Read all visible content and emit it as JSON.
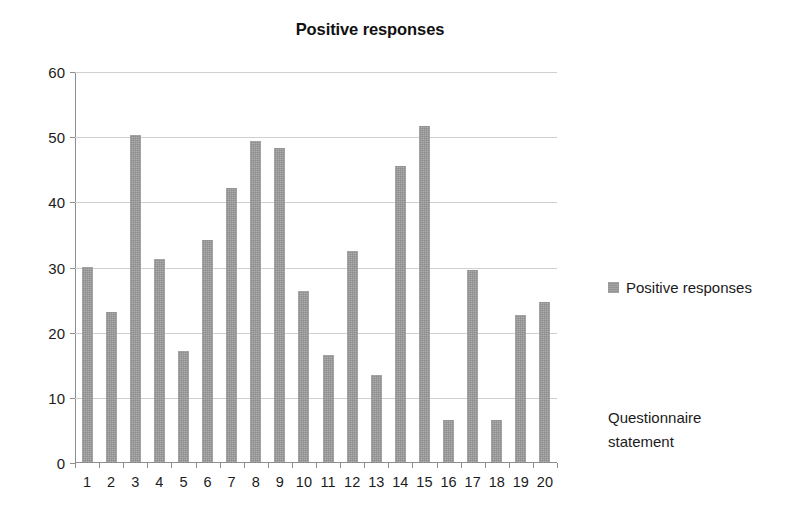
{
  "chart_data": {
    "type": "bar",
    "title": "Positive responses",
    "xlabel": "Questionnaire statement",
    "ylabel": "",
    "categories": [
      "1",
      "2",
      "3",
      "4",
      "5",
      "6",
      "7",
      "8",
      "9",
      "10",
      "11",
      "12",
      "13",
      "14",
      "15",
      "16",
      "17",
      "18",
      "19",
      "20"
    ],
    "series": [
      {
        "name": "Positive responses",
        "color": "#9a9a9a",
        "values": [
          30.0,
          23.0,
          50.2,
          31.1,
          17.1,
          34.1,
          42.1,
          49.2,
          48.2,
          26.3,
          16.4,
          32.4,
          13.4,
          45.4,
          51.5,
          6.5,
          29.5,
          6.5,
          22.6,
          24.6
        ]
      }
    ],
    "ylim": [
      0,
      60
    ],
    "yticks": [
      0,
      10,
      20,
      30,
      40,
      50,
      60
    ],
    "ytick_labels": [
      "0",
      "10",
      "20",
      "30",
      "40",
      "50",
      "60"
    ],
    "grid": true,
    "grid_axis": "y",
    "legend_position": "right",
    "legend_entries": [
      "Positive responses"
    ]
  },
  "chart": {
    "title": "Positive responses",
    "axis_caption_line1": "Questionnaire",
    "axis_caption_line2": "statement",
    "legend_label": "Positive responses"
  }
}
